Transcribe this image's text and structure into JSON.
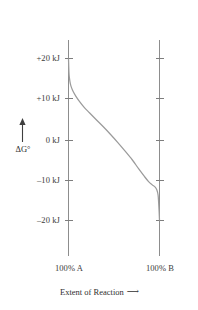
{
  "figure": {
    "name": "free-energy-vs-extent-of-reaction",
    "background_color": "#ffffff",
    "curve_color": "#9b9b9b",
    "axis_color": "#8d8d8d",
    "text_color": "#3b3b3b"
  },
  "y_axis": {
    "label": "ΔG°",
    "unit": "kJ",
    "arrow_icon": "up-arrow-icon",
    "ticks": [
      {
        "value": 20,
        "label": "+20 kJ"
      },
      {
        "value": 10,
        "label": "+10 kJ"
      },
      {
        "value": 0,
        "label": "0 kJ"
      },
      {
        "value": -10,
        "label": "–10 kJ"
      },
      {
        "value": -20,
        "label": "–20 kJ"
      }
    ]
  },
  "x_axis": {
    "caption": "Extent of Reaction",
    "caption_arrow": "⟶",
    "arrow_icon": "right-arrow-icon",
    "ticks": [
      {
        "value": 0,
        "label": "100% A"
      },
      {
        "value": 100,
        "label": "100% B"
      }
    ]
  },
  "chart_data": {
    "type": "line",
    "title": "",
    "subtitle": "",
    "xlabel": "Extent of Reaction",
    "ylabel": "ΔG°",
    "xlim": [
      0,
      100
    ],
    "ylim": [
      -24,
      24
    ],
    "grid": false,
    "legend": "none",
    "x_tick_labels": [
      "100% A",
      "100% B"
    ],
    "x_tick_values": [
      0,
      100
    ],
    "y_tick_labels": [
      "+20 kJ",
      "+10 kJ",
      "0 kJ",
      "–10 kJ",
      "–20 kJ"
    ],
    "y_tick_values": [
      20,
      10,
      0,
      -10,
      -20
    ],
    "series": [
      {
        "name": "Free energy of reaction mixture",
        "color": "#9b9b9b",
        "x": [
          0,
          0.5,
          1,
          2,
          3,
          5,
          8,
          12,
          17,
          23,
          30,
          38,
          46,
          54,
          62,
          70,
          77,
          83,
          88,
          92,
          95,
          97,
          98.5,
          99.5,
          100
        ],
        "y": [
          20.0,
          16.6,
          15.2,
          13.8,
          13.0,
          11.9,
          10.7,
          9.4,
          8.0,
          6.6,
          5.0,
          3.2,
          1.3,
          -0.7,
          -2.8,
          -5.0,
          -7.2,
          -9.0,
          -10.4,
          -11.2,
          -11.7,
          -12.4,
          -13.8,
          -17.4,
          -20.0
        ]
      }
    ],
    "annotations": [
      {
        "text": "Curve begins at +20 kJ at 100% A and falls steeply, then descends smoothly through 0 kJ near the midpoint and plunges to –20 kJ at 100% B."
      }
    ]
  }
}
